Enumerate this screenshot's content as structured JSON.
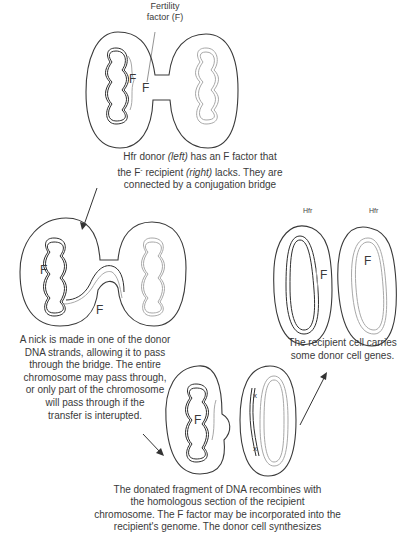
{
  "labels": {
    "fertility_factor": [
      "Fertility",
      "factor (F)"
    ],
    "f_letter": "F",
    "hfr_left": "Hfr",
    "hfr_right": "Hfr",
    "x_marker": "x"
  },
  "captions": {
    "step1": {
      "line1": "Hfr donor ",
      "line1_italic": "(left)",
      "line1_rest": " has an F factor that",
      "line2": "the F",
      "line2_sup": "-",
      "line2_mid": " recipient ",
      "line2_italic": "(right)",
      "line2_rest": " lacks. They are",
      "line3": "connected by a conjugation bridge"
    },
    "step2": [
      "A nick is made in one of the donor",
      "DNA strands, allowing it to pass",
      "through the bridge. The entire",
      "chromosome may pass through,",
      "or only part of the chromosome",
      "will pass through if the",
      "transfer is interupted."
    ],
    "step3": [
      "The donated fragment of DNA recombines with",
      "the homologous section of the recipient",
      "chromosome. The F factor may be incorporated into the",
      "recipient's genome. The donor cell synthesizes"
    ],
    "step4": [
      "The recipient cell carries",
      "some donor cell genes."
    ]
  },
  "colors": {
    "line": "#3a3a3a",
    "donor_dna": "#2e2e2e",
    "recipient_dna": "#a8a8a8",
    "background": "#ffffff"
  }
}
